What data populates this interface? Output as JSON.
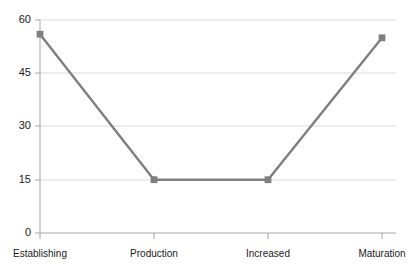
{
  "chart_data": {
    "type": "line",
    "title": "",
    "subtitle": "",
    "xlabel": "",
    "ylabel": "",
    "categories": [
      "Establishing",
      "Production",
      "Increased",
      "Maturation"
    ],
    "values": [
      56,
      15,
      15,
      55
    ],
    "series": [
      {
        "name": "",
        "values": [
          56,
          15,
          15,
          55
        ]
      }
    ],
    "ylim": [
      0,
      60
    ],
    "yticks": [
      0,
      15,
      30,
      45,
      60
    ],
    "ytick_labels": [
      "0",
      "15",
      "30",
      "45",
      "60"
    ],
    "xtick_labels": [
      "Establishing",
      "Production",
      "Increased",
      "Maturation"
    ],
    "grid": true,
    "grid_axis": "y",
    "legend": false,
    "legend_position": "none",
    "markers": "square",
    "colors": {
      "line": "#7f7f7f",
      "marker": "#7f7f7f",
      "grid": "#d9d9d9",
      "axis": "#a6a6a6",
      "text": "#1a1a1a",
      "background": "#ffffff"
    }
  },
  "axis": {
    "y_labels": [
      {
        "text": "60",
        "top": 14
      },
      {
        "text": "45",
        "top": 67
      },
      {
        "text": "30",
        "top": 120
      },
      {
        "text": "15",
        "top": 173
      },
      {
        "text": "0",
        "top": 226
      }
    ],
    "x_labels": [
      {
        "text": "Establishing",
        "left": 40
      },
      {
        "text": "Production",
        "left": 154
      },
      {
        "text": "Increased",
        "left": 268
      },
      {
        "text": "Maturation",
        "left": 382
      }
    ]
  }
}
